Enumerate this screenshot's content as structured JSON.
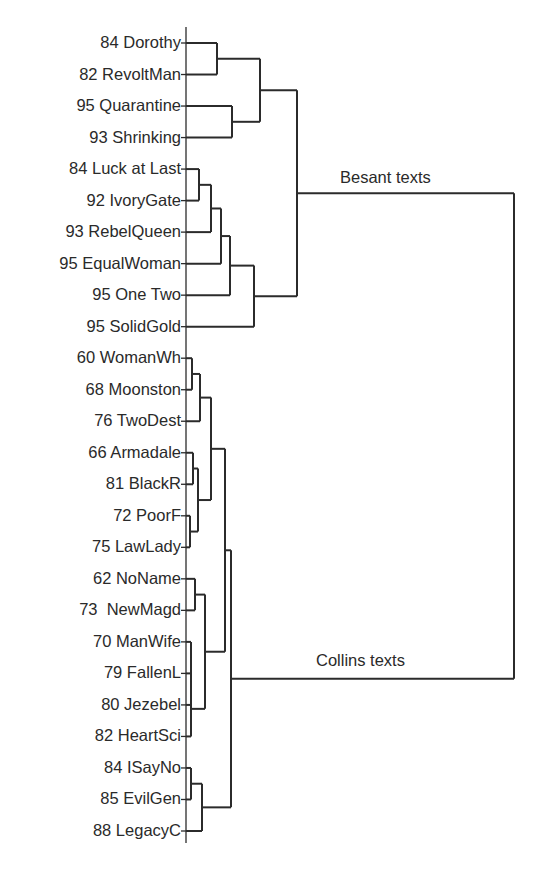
{
  "diagram": {
    "type": "dendrogram",
    "orientation": "horizontal",
    "axis": {
      "x": 186,
      "y_top": 27,
      "y_bottom": 843
    },
    "leaves": [
      {
        "label": "84 Dorothy"
      },
      {
        "label": "82 RevoltMan"
      },
      {
        "label": "95 Quarantine"
      },
      {
        "label": "93 Shrinking"
      },
      {
        "label": "84 Luck at Last"
      },
      {
        "label": "92 IvoryGate"
      },
      {
        "label": "93 RebelQueen"
      },
      {
        "label": "95 EqualWoman"
      },
      {
        "label": "95 One Two"
      },
      {
        "label": "95 SolidGold"
      },
      {
        "label": "60 WomanWh"
      },
      {
        "label": "68 Moonston"
      },
      {
        "label": "76 TwoDest"
      },
      {
        "label": "66 Armadale"
      },
      {
        "label": "81 BlackR"
      },
      {
        "label": "72 PoorF"
      },
      {
        "label": "75 LawLady"
      },
      {
        "label": "62 NoName"
      },
      {
        "label": "73  NewMagd"
      },
      {
        "label": "70 ManWife"
      },
      {
        "label": "79 FallenL"
      },
      {
        "label": "80 Jezebel"
      },
      {
        "label": "82 HeartSci"
      },
      {
        "label": "84 ISayNo"
      },
      {
        "label": "85 EvilGen"
      },
      {
        "label": "88 LegacyC"
      }
    ],
    "clusters": {
      "besant": {
        "label": "Besant texts"
      },
      "collins": {
        "label": "Collins texts"
      }
    },
    "merges": [
      {
        "a": "L0",
        "b": "L1",
        "x": 217,
        "id": "B1"
      },
      {
        "a": "L2",
        "b": "L3",
        "x": 232,
        "id": "B2"
      },
      {
        "a": "B1",
        "b": "B2",
        "x": 260,
        "id": "B3"
      },
      {
        "a": "L4",
        "b": "L5",
        "x": 199,
        "id": "B4"
      },
      {
        "a": "B4",
        "b": "L6",
        "x": 211,
        "id": "B5"
      },
      {
        "a": "B5",
        "b": "L7",
        "x": 221,
        "id": "B6"
      },
      {
        "a": "B6",
        "b": "L8",
        "x": 230,
        "id": "B7"
      },
      {
        "a": "B7",
        "b": "L9",
        "x": 254,
        "id": "B8"
      },
      {
        "a": "B3",
        "b": "B8",
        "x": 297,
        "id": "BESANT"
      },
      {
        "a": "L10",
        "b": "L11",
        "x": 192,
        "id": "C1"
      },
      {
        "a": "C1",
        "b": "L12",
        "x": 200,
        "id": "C2"
      },
      {
        "a": "L13",
        "b": "L14",
        "x": 193,
        "id": "C3"
      },
      {
        "a": "L15",
        "b": "L16",
        "x": 190,
        "id": "C4"
      },
      {
        "a": "C3",
        "b": "C4",
        "x": 198,
        "id": "C5"
      },
      {
        "a": "C2",
        "b": "C5",
        "x": 211,
        "id": "C6"
      },
      {
        "a": "L17",
        "b": "L18",
        "x": 195,
        "id": "C7"
      },
      {
        "a": "L19",
        "b": "L20",
        "x": 191,
        "id": "C8"
      },
      {
        "a": "C8",
        "b": "L21",
        "x": 191,
        "id": "C9"
      },
      {
        "a": "C9",
        "b": "L22",
        "x": 191,
        "id": "C10"
      },
      {
        "a": "C7",
        "b": "C10",
        "x": 205,
        "id": "C11"
      },
      {
        "a": "C6",
        "b": "C11",
        "x": 225,
        "id": "C12"
      },
      {
        "a": "L23",
        "b": "L24",
        "x": 191,
        "id": "C13"
      },
      {
        "a": "C13",
        "b": "L25",
        "x": 202,
        "id": "C14"
      },
      {
        "a": "C12",
        "b": "C14",
        "x": 231,
        "id": "COLLINS"
      },
      {
        "a": "BESANT",
        "b": "COLLINS",
        "x": 514,
        "id": "ROOT"
      }
    ]
  }
}
